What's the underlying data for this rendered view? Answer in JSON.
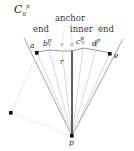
{
  "figure": {
    "cone_label": {
      "base": "C",
      "sub": "0",
      "sup": "p"
    },
    "annotations": [
      {
        "id": "end-left",
        "text": "end"
      },
      {
        "id": "anchor",
        "text": "anchor"
      },
      {
        "id": "inner",
        "text": "inner"
      },
      {
        "id": "end-right",
        "text": "end"
      }
    ],
    "point_labels": [
      {
        "id": "a",
        "base": "a",
        "sup": ""
      },
      {
        "id": "b",
        "base": "b",
        "sup": "p"
      },
      {
        "id": "c",
        "base": "c",
        "sup": "p"
      },
      {
        "id": "d",
        "base": "d",
        "sup": "p"
      },
      {
        "id": "e",
        "base": "e",
        "sup": ""
      },
      {
        "id": "r",
        "base": "r",
        "sup": ""
      },
      {
        "id": "p",
        "base": "p",
        "sup": ""
      }
    ],
    "colors": {
      "apex_ray": "#111111",
      "fan_ray": "#c9c9c9",
      "cone_boundary": "#8c8c8c",
      "polyline": "#9a9a9a",
      "marker": "#bdbdbd",
      "dot": "#111111",
      "background": "#ffffff"
    },
    "geometry": {
      "apex": {
        "x": 72,
        "y": 136
      },
      "polyline_points": [
        {
          "x": 37,
          "y": 52
        },
        {
          "x": 49,
          "y": 50
        },
        {
          "x": 62,
          "y": 51
        },
        {
          "x": 72,
          "y": 51
        },
        {
          "x": 83,
          "y": 48
        },
        {
          "x": 96,
          "y": 50
        },
        {
          "x": 110,
          "y": 53
        }
      ],
      "dots": [
        {
          "id": "dot-a",
          "x": 37,
          "y": 53
        },
        {
          "id": "dot-e",
          "x": 110,
          "y": 54
        },
        {
          "id": "dot-lower-left",
          "x": 11,
          "y": 113
        },
        {
          "id": "dot-p",
          "x": 72,
          "y": 136
        }
      ]
    }
  }
}
